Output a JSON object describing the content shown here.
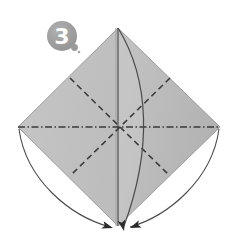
{
  "figure": {
    "kind": "origami-fold-diagram",
    "step_label": "3",
    "background_color": "#ffffff",
    "paper_color": "#bfbfbf",
    "paper_shade_light": "#cfcfcf",
    "paper_shade_dark": "#b0b0b0",
    "line_color": "#3a3a3a",
    "badge_color": "#9a9a9a"
  },
  "badge": {
    "number": "3",
    "center_x": 62,
    "center_y": 36,
    "radius": 15,
    "tail_x": 75,
    "tail_y": 48,
    "tail_radius": 3.5
  },
  "paper": {
    "shape": "diamond",
    "top": {
      "x": 118,
      "y": 28
    },
    "left": {
      "x": 18,
      "y": 127
    },
    "right": {
      "x": 220,
      "y": 127
    },
    "bottom": {
      "x": 118,
      "y": 226
    }
  },
  "fold_lines": [
    {
      "name": "vertical-center-fold",
      "style": "solid",
      "from": {
        "x": 118,
        "y": 28
      },
      "to": {
        "x": 118,
        "y": 226
      }
    },
    {
      "name": "horizontal-center-fold",
      "style": "dash-dot",
      "from": {
        "x": 18,
        "y": 127
      },
      "to": {
        "x": 220,
        "y": 127
      }
    },
    {
      "name": "diagonal-fold-down-right",
      "style": "dashed",
      "from": {
        "x": 70,
        "y": 78
      },
      "to": {
        "x": 170,
        "y": 176
      }
    },
    {
      "name": "diagonal-fold-down-left",
      "style": "dashed",
      "from": {
        "x": 170,
        "y": 78
      },
      "to": {
        "x": 70,
        "y": 176
      }
    }
  ],
  "curves": [
    {
      "name": "inner-fold-curve",
      "path": "M 118 28 C 150 80, 152 150, 124 226"
    },
    {
      "name": "left-motion-arc",
      "path": "M 19 129 C 26 180, 70 216, 110 227"
    },
    {
      "name": "right-motion-arc",
      "path": "M 219 129 C 212 180, 168 216, 128 227"
    }
  ],
  "arrowheads": [
    {
      "name": "arrowhead-left-to-bottom",
      "x": 113,
      "y": 228,
      "angle": 20
    },
    {
      "name": "arrowhead-center-to-bottom",
      "x": 125,
      "y": 230,
      "angle": 75
    },
    {
      "name": "arrowhead-right-to-bottom",
      "x": 131,
      "y": 228,
      "angle": 160
    },
    {
      "name": "arrowhead-right-edge-pointer",
      "x": 226,
      "y": 95,
      "angle": 180
    }
  ]
}
